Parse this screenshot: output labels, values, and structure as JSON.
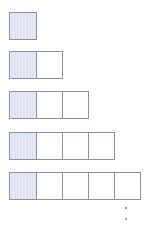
{
  "diagram": {
    "rows": [
      {
        "cells": 1,
        "shaded_index": 0
      },
      {
        "cells": 2,
        "shaded_index": 0
      },
      {
        "cells": 3,
        "shaded_index": 0
      },
      {
        "cells": 4,
        "shaded_index": 0
      },
      {
        "cells": 5,
        "shaded_index": 0
      }
    ],
    "continuation": "vertical ellipsis (2 dots)",
    "colors": {
      "shaded_fill": "#dfe3ef",
      "border": "#8a90a8",
      "empty_fill": "#ffffff",
      "dot": "#7a7a7a"
    }
  }
}
